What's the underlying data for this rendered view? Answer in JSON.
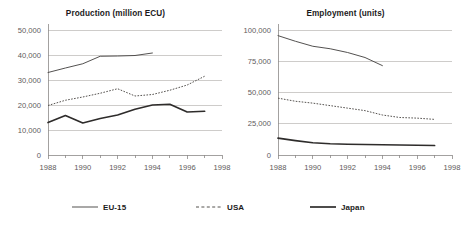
{
  "figure": {
    "background": "#ffffff",
    "series_colors": {
      "eu15": "#4a4847",
      "usa": "#55524f",
      "japan": "#2e2c2b"
    },
    "gridline_color": "#b9b6b4",
    "tick_label_color": "#5e5a5b"
  },
  "legend": {
    "position": "bottom",
    "items": [
      {
        "key": "eu15",
        "label": "EU-15",
        "style": "solid-thin"
      },
      {
        "key": "usa",
        "label": "USA",
        "style": "dashed"
      },
      {
        "key": "japan",
        "label": "Japan",
        "style": "solid-thick"
      }
    ]
  },
  "chart_data": [
    {
      "id": "production",
      "type": "line",
      "title": "Production (million ECU)",
      "xlabel": "",
      "ylabel": "",
      "xlim": [
        1988,
        1998
      ],
      "ylim": [
        0,
        50000
      ],
      "grid": true,
      "xticks": [
        1988,
        1990,
        1992,
        1994,
        1996,
        1998
      ],
      "xtick_labels": [
        "1988",
        "1990",
        "1992",
        "1994",
        "1996",
        "1998"
      ],
      "yticks": [
        0,
        10000,
        20000,
        30000,
        40000,
        50000
      ],
      "ytick_labels": [
        "0",
        "10,000",
        "20,000",
        "30,000",
        "40,000",
        "50,000"
      ],
      "series": [
        {
          "name": "EU-15",
          "style": "solid-thin",
          "x": [
            1988,
            1989,
            1990,
            1991,
            1992,
            1993,
            1994
          ],
          "values": [
            33000,
            34800,
            36500,
            39500,
            39600,
            39800,
            40800
          ]
        },
        {
          "name": "USA",
          "style": "dashed",
          "x": [
            1988,
            1989,
            1990,
            1991,
            1992,
            1993,
            1994,
            1995,
            1996,
            1997
          ],
          "values": [
            19800,
            21900,
            23200,
            24700,
            26500,
            23600,
            24200,
            25900,
            28000,
            31500
          ]
        },
        {
          "name": "Japan",
          "style": "solid-thick",
          "x": [
            1988,
            1989,
            1990,
            1991,
            1992,
            1993,
            1994,
            1995,
            1996,
            1997
          ],
          "values": [
            13000,
            15800,
            12800,
            14600,
            16000,
            18300,
            20000,
            20300,
            17200,
            17500
          ]
        }
      ]
    },
    {
      "id": "employment",
      "type": "line",
      "title": "Employment (units)",
      "xlabel": "",
      "ylabel": "",
      "xlim": [
        1988,
        1998
      ],
      "ylim": [
        0,
        100000
      ],
      "grid": true,
      "xticks": [
        1988,
        1990,
        1992,
        1994,
        1996,
        1998
      ],
      "xtick_labels": [
        "1988",
        "1990",
        "1992",
        "1994",
        "1996",
        "1998"
      ],
      "yticks": [
        0,
        25000,
        50000,
        75000,
        100000
      ],
      "ytick_labels": [
        "0",
        "25,000",
        "50,000",
        "75,000",
        "100,000"
      ],
      "series": [
        {
          "name": "EU-15",
          "style": "solid-thin",
          "x": [
            1988,
            1989,
            1990,
            1991,
            1992,
            1993,
            1994
          ],
          "values": [
            95500,
            91000,
            87000,
            85000,
            82000,
            78000,
            71500
          ]
        },
        {
          "name": "USA",
          "style": "dashed",
          "x": [
            1988,
            1989,
            1990,
            1991,
            1992,
            1993,
            1994,
            1995,
            1996,
            1997
          ],
          "values": [
            45500,
            43000,
            41500,
            39500,
            37500,
            35500,
            32000,
            30000,
            29500,
            28500
          ]
        },
        {
          "name": "Japan",
          "style": "solid-thick",
          "x": [
            1988,
            1989,
            1990,
            1991,
            1992,
            1993,
            1994,
            1995,
            1996,
            1997
          ],
          "values": [
            13500,
            11500,
            9800,
            9000,
            8600,
            8400,
            8200,
            8000,
            7800,
            7600
          ]
        }
      ]
    }
  ]
}
